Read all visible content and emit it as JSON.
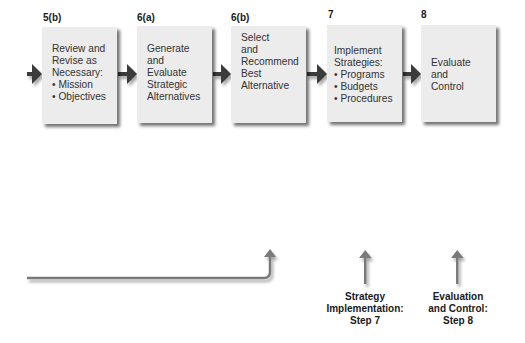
{
  "steps": [
    {
      "label": "5(b)",
      "lines": [
        "Review and",
        "Revise as",
        "Necessary:",
        "• Mission",
        "• Objectives"
      ]
    },
    {
      "label": "6(a)",
      "lines": [
        "Generate",
        "and",
        "Evaluate",
        "Strategic",
        "Alternatives"
      ]
    },
    {
      "label": "6(b)",
      "lines": [
        "Select",
        "and",
        "Recommend",
        "Best",
        "Alternative"
      ]
    },
    {
      "label": "7",
      "lines": [
        "Implement",
        "Strategies:",
        "• Programs",
        "• Budgets",
        "• Procedures"
      ]
    },
    {
      "label": "8",
      "lines": [
        "Evaluate",
        "and",
        "Control"
      ]
    }
  ],
  "captions": [
    {
      "lines": [
        "Strategy",
        "Implementation:",
        "Step 7"
      ]
    },
    {
      "lines": [
        "Evaluation",
        "and Control:",
        "Step 8"
      ]
    }
  ],
  "colors": {
    "box_fill": "#ececec",
    "arrow_dark": "#3a3a3a",
    "arrow_gray": "#7a7a7a"
  }
}
